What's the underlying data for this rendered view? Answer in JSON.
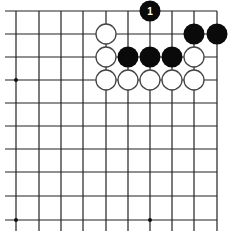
{
  "diagram": {
    "type": "go-board-fragment",
    "grid": {
      "x": [
        16,
        39,
        61,
        83,
        106,
        128,
        150,
        172,
        194,
        217
      ],
      "y": [
        11,
        34,
        57,
        80,
        103,
        126,
        149,
        172,
        196,
        220
      ],
      "edges": {
        "top": true,
        "right": true,
        "bottom": false,
        "left": false
      },
      "line_color": "#222222",
      "extend_left_to": 5,
      "extend_bottom_to": 231
    },
    "star_points": [
      {
        "col": 0,
        "row": 3
      },
      {
        "col": 0,
        "row": 9
      },
      {
        "col": 6,
        "row": 9
      }
    ],
    "stones": [
      {
        "color": "black",
        "col": 6,
        "row": 0,
        "label": "1"
      },
      {
        "color": "white",
        "col": 4,
        "row": 1
      },
      {
        "color": "black",
        "col": 8,
        "row": 1
      },
      {
        "color": "black",
        "col": 9,
        "row": 1
      },
      {
        "color": "white",
        "col": 4,
        "row": 2
      },
      {
        "color": "black",
        "col": 5,
        "row": 2
      },
      {
        "color": "black",
        "col": 6,
        "row": 2
      },
      {
        "color": "black",
        "col": 7,
        "row": 2
      },
      {
        "color": "white",
        "col": 8,
        "row": 2
      },
      {
        "color": "white",
        "col": 4,
        "row": 3
      },
      {
        "color": "white",
        "col": 5,
        "row": 3
      },
      {
        "color": "white",
        "col": 6,
        "row": 3
      },
      {
        "color": "white",
        "col": 7,
        "row": 3
      },
      {
        "color": "white",
        "col": 8,
        "row": 3
      }
    ],
    "colors": {
      "black_stone": "#0a0a0a",
      "white_stone": "#ffffff",
      "white_outline": "#444444",
      "label_on_black": "#ffffff"
    }
  }
}
